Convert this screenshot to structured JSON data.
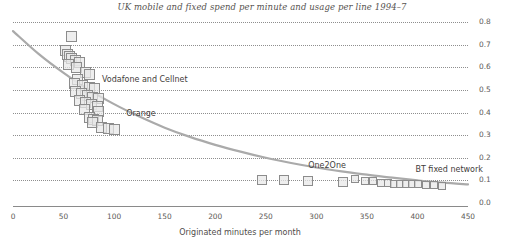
{
  "chart_data": {
    "type": "scatter",
    "title": "UK mobile and fixed spend per minute and usage per line 1994–7",
    "xlabel": "Originated minutes per month",
    "ylabel": "Average price per minute, £",
    "xlim": [
      0,
      450
    ],
    "ylim": [
      0.0,
      0.8
    ],
    "xticks": [
      0,
      50,
      100,
      150,
      200,
      250,
      300,
      350,
      400,
      450
    ],
    "xtick_labels": [
      "0",
      "50",
      "100",
      "150",
      "200",
      "250",
      "300",
      "350",
      "400",
      "450"
    ],
    "yticks": [
      0.0,
      0.1,
      0.2,
      0.3,
      0.4,
      0.5,
      0.6,
      0.7,
      0.8
    ],
    "ytick_labels": [
      "0.0",
      "0.1",
      "0.2",
      "0.3",
      "0.4",
      "0.5",
      "0.6",
      "0.7",
      "0.8"
    ],
    "grid": "horizontal-dotted",
    "legend": "none",
    "marker": "square",
    "marker_fill": "#e8e8e8",
    "marker_edge": "#8c8c8c",
    "trend_color": "#a8a8a8",
    "annotations": [
      {
        "text": "Vodafone and Cellnet",
        "x": 88,
        "y": 0.545
      },
      {
        "text": "Orange",
        "x": 112,
        "y": 0.395
      },
      {
        "text": "One2One",
        "x": 292,
        "y": 0.165
      },
      {
        "text": "BT fixed network",
        "x": 398,
        "y": 0.145
      }
    ],
    "points": [
      {
        "x": 58,
        "y": 0.735
      },
      {
        "x": 52,
        "y": 0.675
      },
      {
        "x": 54,
        "y": 0.658
      },
      {
        "x": 56,
        "y": 0.648
      },
      {
        "x": 58,
        "y": 0.638
      },
      {
        "x": 62,
        "y": 0.63
      },
      {
        "x": 66,
        "y": 0.622
      },
      {
        "x": 55,
        "y": 0.612
      },
      {
        "x": 63,
        "y": 0.6
      },
      {
        "x": 72,
        "y": 0.575
      },
      {
        "x": 76,
        "y": 0.568
      },
      {
        "x": 64,
        "y": 0.545
      },
      {
        "x": 61,
        "y": 0.53
      },
      {
        "x": 69,
        "y": 0.52
      },
      {
        "x": 76,
        "y": 0.512
      },
      {
        "x": 81,
        "y": 0.505
      },
      {
        "x": 62,
        "y": 0.492
      },
      {
        "x": 68,
        "y": 0.484
      },
      {
        "x": 74,
        "y": 0.476
      },
      {
        "x": 79,
        "y": 0.468
      },
      {
        "x": 85,
        "y": 0.46
      },
      {
        "x": 66,
        "y": 0.452
      },
      {
        "x": 72,
        "y": 0.444
      },
      {
        "x": 78,
        "y": 0.436
      },
      {
        "x": 84,
        "y": 0.428
      },
      {
        "x": 71,
        "y": 0.412
      },
      {
        "x": 85,
        "y": 0.405
      },
      {
        "x": 76,
        "y": 0.378
      },
      {
        "x": 80,
        "y": 0.37
      },
      {
        "x": 84,
        "y": 0.364
      },
      {
        "x": 79,
        "y": 0.358
      },
      {
        "x": 88,
        "y": 0.335
      },
      {
        "x": 94,
        "y": 0.33
      },
      {
        "x": 100,
        "y": 0.326
      },
      {
        "x": 246,
        "y": 0.103
      },
      {
        "x": 268,
        "y": 0.1
      },
      {
        "x": 292,
        "y": 0.098
      },
      {
        "x": 326,
        "y": 0.092
      },
      {
        "x": 338,
        "y": 0.104
      },
      {
        "x": 348,
        "y": 0.098
      },
      {
        "x": 356,
        "y": 0.096
      },
      {
        "x": 364,
        "y": 0.09
      },
      {
        "x": 371,
        "y": 0.088
      },
      {
        "x": 377,
        "y": 0.086
      },
      {
        "x": 383,
        "y": 0.085
      },
      {
        "x": 389,
        "y": 0.084
      },
      {
        "x": 395,
        "y": 0.083
      },
      {
        "x": 401,
        "y": 0.082
      },
      {
        "x": 408,
        "y": 0.08
      },
      {
        "x": 416,
        "y": 0.078
      },
      {
        "x": 424,
        "y": 0.076
      }
    ],
    "trend_curve": [
      {
        "x": 0,
        "y": 0.76
      },
      {
        "x": 25,
        "y": 0.66
      },
      {
        "x": 50,
        "y": 0.575
      },
      {
        "x": 75,
        "y": 0.5
      },
      {
        "x": 100,
        "y": 0.437
      },
      {
        "x": 125,
        "y": 0.382
      },
      {
        "x": 150,
        "y": 0.333
      },
      {
        "x": 175,
        "y": 0.292
      },
      {
        "x": 200,
        "y": 0.257
      },
      {
        "x": 225,
        "y": 0.227
      },
      {
        "x": 250,
        "y": 0.2
      },
      {
        "x": 275,
        "y": 0.177
      },
      {
        "x": 300,
        "y": 0.157
      },
      {
        "x": 325,
        "y": 0.14
      },
      {
        "x": 350,
        "y": 0.125
      },
      {
        "x": 375,
        "y": 0.112
      },
      {
        "x": 400,
        "y": 0.1
      },
      {
        "x": 425,
        "y": 0.09
      },
      {
        "x": 450,
        "y": 0.082
      }
    ]
  }
}
